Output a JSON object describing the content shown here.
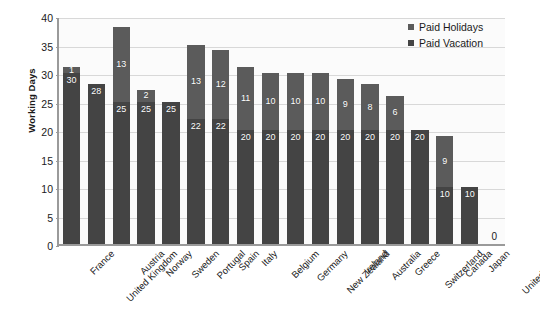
{
  "chart_data": {
    "type": "bar",
    "subtype": "stacked-vertical",
    "title": "",
    "xlabel": "",
    "ylabel": "Working Days",
    "ylim": [
      0,
      40
    ],
    "ytick_step": 5,
    "yticks": [
      "40",
      "35",
      "30",
      "25",
      "20",
      "15",
      "10",
      "5",
      "0"
    ],
    "grid": true,
    "legend_position": "top-right",
    "categories": [
      "France",
      "United Kingdom",
      "Austria",
      "Norway",
      "Sweden",
      "Portugal",
      "Spain",
      "Italy",
      "Belgium",
      "Germany",
      "New Zealand",
      "Ireland",
      "Australia",
      "Greece",
      "Switzerland",
      "Canada",
      "Japan",
      "United States"
    ],
    "series": [
      {
        "name": "Paid Vacation",
        "color": "#444444",
        "values": [
          30,
          28,
          25,
          25,
          25,
          22,
          22,
          20,
          20,
          20,
          20,
          20,
          20,
          20,
          20,
          10,
          10,
          0
        ],
        "labels": [
          "30",
          "28",
          "25",
          "25",
          "25",
          "22",
          "22",
          "20",
          "20",
          "20",
          "20",
          "20",
          "20",
          "20",
          "20",
          "10",
          "10",
          ""
        ]
      },
      {
        "name": "Paid Holidays",
        "color": "#5b5b5b",
        "values": [
          1,
          0,
          13,
          2,
          0,
          13,
          12,
          11,
          10,
          10,
          10,
          9,
          8,
          6,
          0,
          9,
          0,
          0
        ],
        "labels": [
          "1",
          "",
          "13",
          "2",
          "",
          "13",
          "12",
          "11",
          "10",
          "10",
          "10",
          "9",
          "8",
          "6",
          "",
          "9",
          "",
          ""
        ]
      }
    ],
    "totals": [
      31,
      28,
      38,
      27,
      25,
      35,
      34,
      31,
      30,
      30,
      30,
      29,
      28,
      26,
      20,
      19,
      10,
      0
    ],
    "zero_value_label": "0",
    "zero_value_category": "United States"
  },
  "legend": {
    "items": [
      {
        "label": "Paid Holidays",
        "color": "#5b5b5b"
      },
      {
        "label": "Paid Vacation",
        "color": "#444444"
      }
    ]
  },
  "axes": {
    "y_title": "Working Days"
  },
  "colors": {
    "holidays": "#5b5b5b",
    "vacation": "#444444",
    "gridline": "#d8d8d8",
    "axis": "#9a9a9a",
    "plot_background": "#fbfbfb",
    "text": "#1a1a1a",
    "label_text": "#ffffff"
  }
}
